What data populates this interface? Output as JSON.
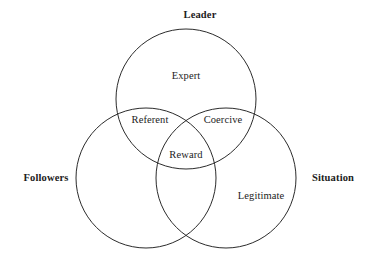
{
  "diagram": {
    "type": "venn",
    "set_count": 3,
    "stroke_color": "#2b2b2b",
    "stroke_width": 1,
    "fill": "none",
    "background_color": "#ffffff",
    "text_color": "#1c1c1c",
    "outer_labels": [
      {
        "id": "leader",
        "text": "Leader",
        "x": 200,
        "y": 15
      },
      {
        "id": "followers",
        "text": "Followers",
        "x": 46,
        "y": 178
      },
      {
        "id": "situation",
        "text": "Situation",
        "x": 333,
        "y": 178
      }
    ],
    "circles": [
      {
        "id": "leader",
        "cx": 186,
        "cy": 99,
        "r": 70
      },
      {
        "id": "followers",
        "cx": 146,
        "cy": 178,
        "r": 70
      },
      {
        "id": "situation",
        "cx": 226,
        "cy": 178,
        "r": 70
      }
    ],
    "region_labels": [
      {
        "id": "expert",
        "text": "Expert",
        "x": 186,
        "y": 76,
        "sets": [
          "leader"
        ]
      },
      {
        "id": "referent",
        "text": "Referent",
        "x": 150,
        "y": 120,
        "sets": [
          "leader",
          "followers"
        ]
      },
      {
        "id": "coercive",
        "text": "Coercive",
        "x": 223,
        "y": 120,
        "sets": [
          "leader",
          "situation"
        ]
      },
      {
        "id": "reward",
        "text": "Reward",
        "x": 186,
        "y": 155,
        "sets": [
          "leader",
          "followers",
          "situation"
        ]
      },
      {
        "id": "legitimate",
        "text": "Legitimate",
        "x": 261,
        "y": 196,
        "sets": [
          "situation"
        ]
      }
    ]
  }
}
